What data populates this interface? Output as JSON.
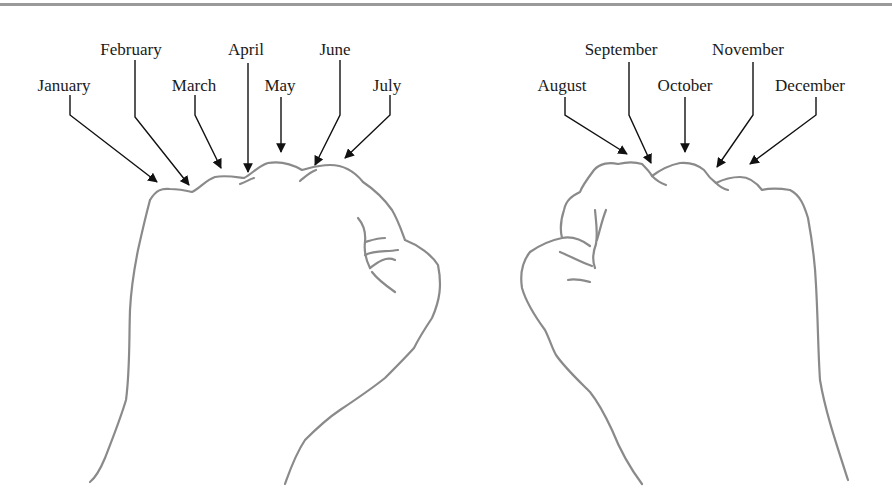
{
  "figure": {
    "left_hand": {
      "labels": [
        {
          "month": "January",
          "x": 64,
          "y": 77
        },
        {
          "month": "February",
          "x": 131,
          "y": 41
        },
        {
          "month": "March",
          "x": 194,
          "y": 77
        },
        {
          "month": "April",
          "x": 246,
          "y": 41
        },
        {
          "month": "May",
          "x": 280,
          "y": 77
        },
        {
          "month": "June",
          "x": 335,
          "y": 41
        },
        {
          "month": "July",
          "x": 387,
          "y": 77
        }
      ]
    },
    "right_hand": {
      "labels": [
        {
          "month": "August",
          "x": 562,
          "y": 77
        },
        {
          "month": "September",
          "x": 621,
          "y": 41
        },
        {
          "month": "October",
          "x": 685,
          "y": 77
        },
        {
          "month": "November",
          "x": 748,
          "y": 41
        },
        {
          "month": "December",
          "x": 810,
          "y": 77
        }
      ]
    },
    "colors": {
      "rule": "#9a9a9a",
      "outline": "#8a8a8a",
      "arrow": "#111111",
      "text": "#1a1a1a"
    }
  }
}
